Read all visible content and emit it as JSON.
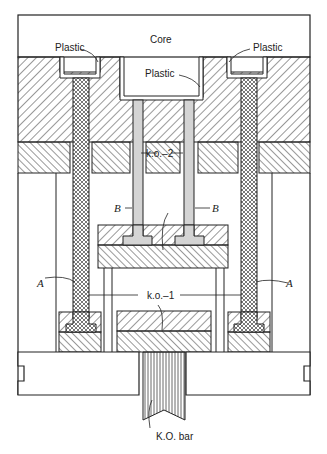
{
  "figure": {
    "labels": {
      "core": "Core",
      "plastic_left": "Plastic",
      "plastic_center": "Plastic",
      "plastic_right": "Plastic",
      "ko2": "k.o.–2",
      "ko1": "k.o.–1",
      "b_left": "B",
      "b_right": "B",
      "a_left": "A",
      "a_right": "A",
      "ko_bar": "K.O. bar"
    },
    "colors": {
      "line": "#222222",
      "background": "#ffffff",
      "pin_gray": "#d4d4d4"
    }
  }
}
